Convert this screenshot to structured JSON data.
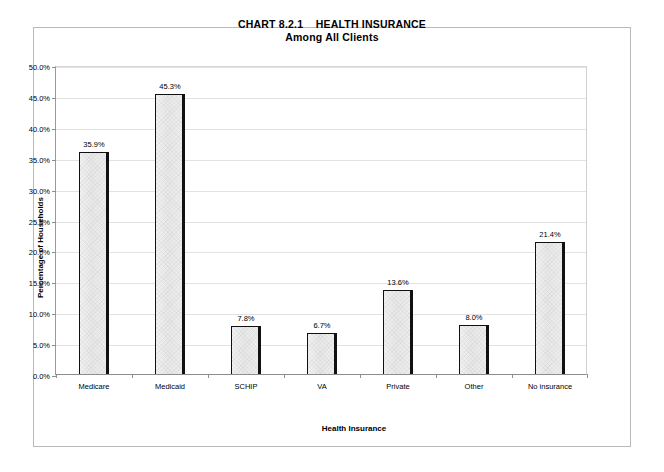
{
  "chart_data": {
    "type": "bar",
    "title": "CHART 8.2.1    HEALTH INSURANCE",
    "subtitle": "Among All Clients",
    "xlabel": "Health Insurance",
    "ylabel": "Percentage of Households",
    "categories": [
      "Medicare",
      "Medicaid",
      "SCHIP",
      "VA",
      "Private",
      "Other",
      "No insurance"
    ],
    "values": [
      35.9,
      45.3,
      7.8,
      6.7,
      13.6,
      8.0,
      21.4
    ],
    "value_labels": [
      "35.9%",
      "45.3%",
      "7.8%",
      "6.7%",
      "13.6%",
      "8.0%",
      "21.4%"
    ],
    "ylim": [
      0,
      50
    ],
    "ytick_values": [
      0,
      5,
      10,
      15,
      20,
      25,
      30,
      35,
      40,
      45,
      50
    ],
    "ytick_labels": [
      "0.0%",
      "5.0%",
      "10.0%",
      "15.0%",
      "20.0%",
      "25.0%",
      "30.0%",
      "35.0%",
      "40.0%",
      "45.0%",
      "50.0%"
    ],
    "grid": true,
    "legend": false,
    "bar_fill_color": "#ececec",
    "bar_border_color": "#111111",
    "gridline_color": "#e2e2e2",
    "background_color": "#ffffff"
  }
}
